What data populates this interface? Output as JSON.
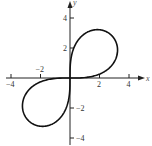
{
  "chart_data": {
    "type": "line",
    "title": "",
    "xlabel": "x",
    "ylabel": "y",
    "xlim": [
      -4.7,
      5.2
    ],
    "ylim": [
      -4.5,
      5.2
    ],
    "grid": false,
    "legend": null,
    "x_ticks": [
      -4,
      -2,
      2,
      4
    ],
    "y_ticks": [
      4,
      2,
      -2,
      -4
    ],
    "x_tick_labels": [
      "−4",
      "−2",
      "2",
      "4"
    ],
    "y_tick_labels": [
      "4",
      "2",
      "−2",
      "−4"
    ],
    "series": [
      {
        "name": "lemniscate r² = 16 sin 2θ",
        "equation": "r^2 = 16 sin(2 theta)",
        "points": [
          [
            0,
            0
          ],
          [
            1.86,
            3.22
          ],
          [
            2.83,
            2.83
          ],
          [
            3.22,
            1.86
          ],
          [
            0,
            0
          ],
          [
            -1.86,
            -3.22
          ],
          [
            -2.83,
            -2.83
          ],
          [
            -3.22,
            -1.86
          ],
          [
            0,
            0
          ]
        ]
      }
    ],
    "colors": {
      "curve": "#111111",
      "axes": "#222222",
      "text": "#333333"
    }
  },
  "axes": {
    "x_label": "x",
    "y_label": "y",
    "x_ticks": [
      {
        "value": -4,
        "label": "−4"
      },
      {
        "value": -2,
        "label": "−2"
      },
      {
        "value": 2,
        "label": "2"
      },
      {
        "value": 4,
        "label": "4"
      }
    ],
    "y_ticks": [
      {
        "value": 4,
        "label": "4"
      },
      {
        "value": 2,
        "label": "2"
      },
      {
        "value": -2,
        "label": "−2"
      },
      {
        "value": -4,
        "label": "−4"
      }
    ]
  }
}
